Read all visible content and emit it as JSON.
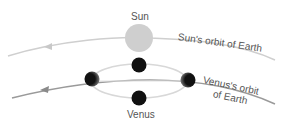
{
  "labels": {
    "sun": "Sun",
    "sun_orbit": "Sun's orbit of Earth",
    "venus_orbit_line1": "Venus's orbit",
    "venus_orbit_line2": "of Earth",
    "venus": "Venus"
  },
  "colors": {
    "sun": "#cfcfcf",
    "sun_orbit": "#c8c8c8",
    "venus_orbit": "#9a9a9a",
    "venus_epicycle": "#d8d8d8",
    "planet": "#111111",
    "label": "#555555"
  }
}
